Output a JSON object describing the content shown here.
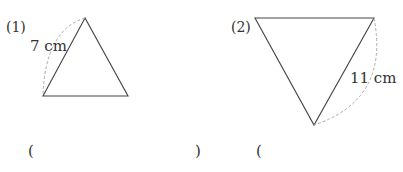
{
  "problems": [
    {
      "number_label": "(1)",
      "shape": "equilateral-triangle",
      "orientation": "apex-up",
      "side_label": "7 cm",
      "answer_open": "(",
      "answer_close": ")"
    },
    {
      "number_label": "(2)",
      "shape": "equilateral-triangle",
      "orientation": "apex-down",
      "side_label": "11 cm",
      "answer_open": "("
    }
  ],
  "colors": {
    "line": "#444444",
    "dashed_arc": "#aaaaaa",
    "text": "#333333"
  }
}
